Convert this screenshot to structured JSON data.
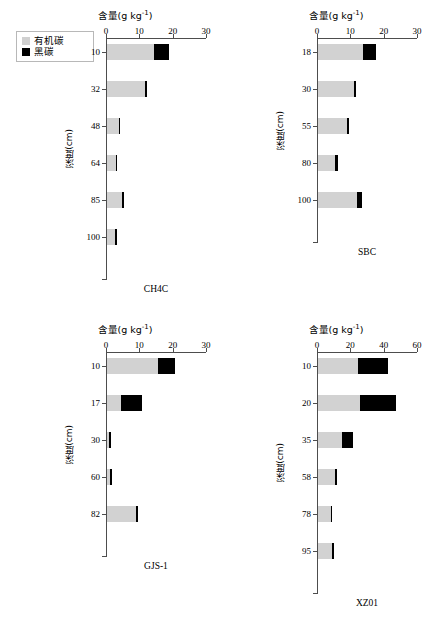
{
  "legend": {
    "items": [
      {
        "label": "有机碳",
        "color": "#d2d2d2",
        "icon": "square-swatch-gray"
      },
      {
        "label": "黑碳",
        "color": "#000000",
        "icon": "square-swatch-black"
      }
    ]
  },
  "axis_title_text": "含量(g kg",
  "axis_title_sup": "-1",
  "axis_title_close": ")",
  "y_axis_title": "深度(cm)",
  "chart_data": [
    {
      "type": "bar",
      "orientation": "horizontal",
      "stacked": true,
      "title": "CH4C",
      "xlabel": "含量(g kg-1)",
      "ylabel": "深度(cm)",
      "xlim": [
        0,
        30
      ],
      "xticks": [
        0,
        10,
        20,
        30
      ],
      "categories": [
        "10",
        "32",
        "48",
        "64",
        "85",
        "100"
      ],
      "grid": false,
      "legend_position": "outside-top-left",
      "series": [
        {
          "name": "有机碳",
          "color": "#d2d2d2",
          "values": [
            14.0,
            11.3,
            3.5,
            2.6,
            4.4,
            2.4
          ]
        },
        {
          "name": "黑碳",
          "color": "#000000",
          "values": [
            4.6,
            0.7,
            0.5,
            0.5,
            0.6,
            0.5
          ]
        }
      ]
    },
    {
      "type": "bar",
      "orientation": "horizontal",
      "stacked": true,
      "title": "SBC",
      "xlabel": "含量(g kg-1)",
      "ylabel": "深度(cm)",
      "xlim": [
        0,
        30
      ],
      "xticks": [
        0,
        10,
        20,
        30
      ],
      "categories": [
        "18",
        "30",
        "55",
        "80",
        "100"
      ],
      "grid": false,
      "legend_position": "none",
      "series": [
        {
          "name": "有机碳",
          "color": "#d2d2d2",
          "values": [
            13.4,
            10.8,
            8.6,
            5.0,
            11.6
          ]
        },
        {
          "name": "黑碳",
          "color": "#000000",
          "values": [
            4.0,
            0.7,
            0.6,
            0.9,
            1.7
          ]
        }
      ]
    },
    {
      "type": "bar",
      "orientation": "horizontal",
      "stacked": true,
      "title": "GJS-1",
      "xlabel": "含量(g kg-1)",
      "ylabel": "深度(cm)",
      "xlim": [
        0,
        30
      ],
      "xticks": [
        0,
        10,
        20,
        30
      ],
      "categories": [
        "10",
        "17",
        "30",
        "60",
        "82"
      ],
      "grid": false,
      "legend_position": "none",
      "series": [
        {
          "name": "有机碳",
          "color": "#d2d2d2",
          "values": [
            15.4,
            4.2,
            0.7,
            1.0,
            8.8
          ]
        },
        {
          "name": "黑碳",
          "color": "#000000",
          "values": [
            5.0,
            6.4,
            0.4,
            0.4,
            0.6
          ]
        }
      ]
    },
    {
      "type": "bar",
      "orientation": "horizontal",
      "stacked": true,
      "title": "XZ01",
      "xlabel": "含量(g kg-1)",
      "ylabel": "深度(cm)",
      "xlim": [
        0,
        60
      ],
      "xticks": [
        0,
        20,
        40,
        60
      ],
      "categories": [
        "10",
        "20",
        "35",
        "58",
        "78",
        "95"
      ],
      "grid": false,
      "legend_position": "none",
      "series": [
        {
          "name": "有机碳",
          "color": "#d2d2d2",
          "values": [
            24.0,
            25.0,
            14.5,
            10.0,
            7.5,
            8.5
          ]
        },
        {
          "name": "黑碳",
          "color": "#000000",
          "values": [
            18.0,
            22.0,
            6.5,
            1.2,
            1.0,
            1.2
          ]
        }
      ]
    }
  ]
}
